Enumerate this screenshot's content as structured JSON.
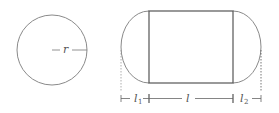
{
  "diagram": {
    "circle": {
      "radius_label": "r",
      "stroke_color": "#888888"
    },
    "capsule": {
      "left_cap_label": "l",
      "left_cap_subscript": "1",
      "middle_label": "l",
      "right_cap_label": "l",
      "right_cap_subscript": "2",
      "rect_stroke_color": "#555555",
      "arc_stroke_color": "#888888"
    }
  }
}
